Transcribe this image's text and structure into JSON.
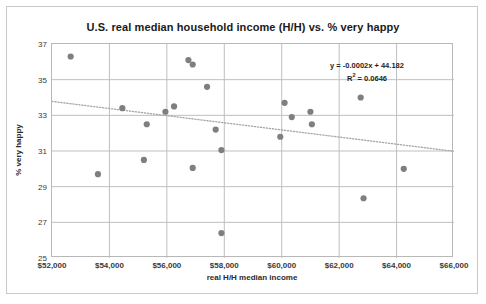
{
  "chart_data": {
    "type": "scatter",
    "title": "U.S. real median household income (H/H) vs. % very happy",
    "xlabel": "real H/H median income",
    "ylabel": "% very happy",
    "xlim": [
      52000,
      66000
    ],
    "ylim": [
      25,
      37
    ],
    "xticks": [
      52000,
      54000,
      56000,
      58000,
      60000,
      62000,
      64000,
      66000
    ],
    "xticklabels": [
      "$52,000",
      "$54,000",
      "$56,000",
      "$58,000",
      "$60,000",
      "$62,000",
      "$64,000",
      "$66,000"
    ],
    "yticks": [
      25,
      27,
      29,
      31,
      33,
      35,
      37
    ],
    "yticklabels": [
      "25",
      "27",
      "29",
      "31",
      "33",
      "35",
      "37"
    ],
    "grid": true,
    "legend": "none",
    "marker_color": "#7f7f7f",
    "gridline_color": "#bfbfbf",
    "trendline_color": "#a6a6a6",
    "points": [
      {
        "x": 52650,
        "y": 36.3
      },
      {
        "x": 53600,
        "y": 29.7
      },
      {
        "x": 54450,
        "y": 33.4
      },
      {
        "x": 55200,
        "y": 30.5
      },
      {
        "x": 55300,
        "y": 32.5
      },
      {
        "x": 55950,
        "y": 33.2
      },
      {
        "x": 56250,
        "y": 33.5
      },
      {
        "x": 56750,
        "y": 36.1
      },
      {
        "x": 56900,
        "y": 35.85
      },
      {
        "x": 56900,
        "y": 30.05
      },
      {
        "x": 57400,
        "y": 34.6
      },
      {
        "x": 57700,
        "y": 32.2
      },
      {
        "x": 57900,
        "y": 31.05
      },
      {
        "x": 57900,
        "y": 26.4
      },
      {
        "x": 59950,
        "y": 31.8
      },
      {
        "x": 60100,
        "y": 33.7
      },
      {
        "x": 60350,
        "y": 32.9
      },
      {
        "x": 61000,
        "y": 33.2
      },
      {
        "x": 61050,
        "y": 32.5
      },
      {
        "x": 62750,
        "y": 34.0
      },
      {
        "x": 62850,
        "y": 28.35
      },
      {
        "x": 64250,
        "y": 30.0
      }
    ],
    "trendline": {
      "equation": "y = -0.0002x + 44.182",
      "r_squared_label": "R",
      "r_squared_exponent": "2",
      "r_squared_value": " = 0.0646",
      "slope": -0.0002,
      "intercept": 44.182,
      "r_squared": 0.0646,
      "style": "dotted",
      "x_start": 52000,
      "y_start": 33.782,
      "x_end": 66000,
      "y_end": 30.982
    }
  }
}
